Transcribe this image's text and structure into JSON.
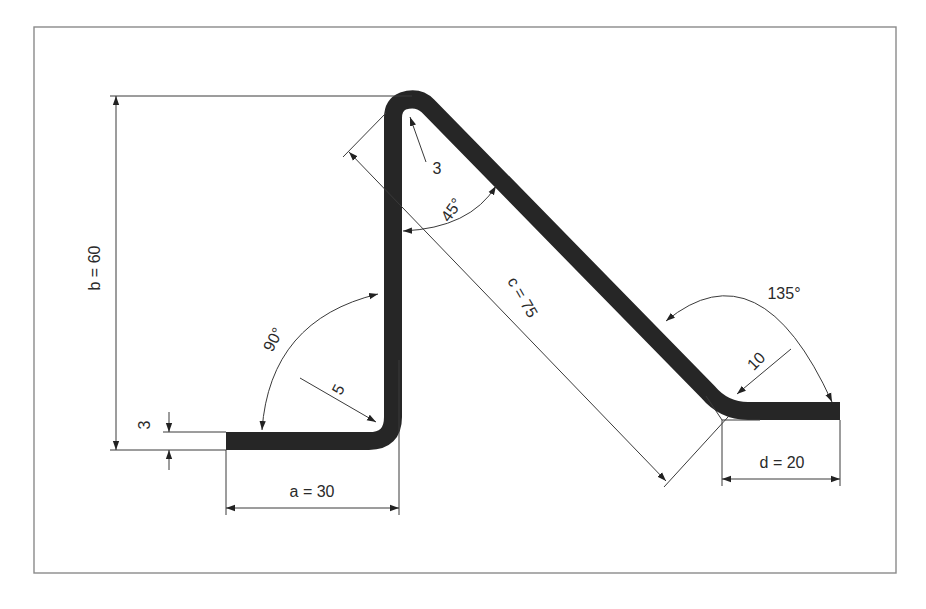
{
  "diagram": {
    "colors": {
      "strip": "#262626",
      "lines": "#3a3a3a",
      "frame": "#8a8a8a",
      "background": "#ffffff"
    },
    "dimensions": {
      "a": {
        "label": "a = 30",
        "value": 30
      },
      "b": {
        "label": "b = 60",
        "value": 60
      },
      "c": {
        "label": "c = 75",
        "value": 75
      },
      "d": {
        "label": "d = 20",
        "value": 20
      },
      "thickness": {
        "label": "3",
        "value": 3
      }
    },
    "radii": {
      "bottom_left_bend": {
        "label": "5",
        "value": 5
      },
      "top_bend": {
        "label": "3",
        "value": 3
      },
      "bottom_right_bend": {
        "label": "10",
        "value": 10
      }
    },
    "angles": {
      "left_bend": {
        "label": "90°",
        "value": 90
      },
      "top_bend": {
        "label": "45°",
        "value": 45
      },
      "right_bend": {
        "label": "135°",
        "value": 135
      }
    }
  }
}
